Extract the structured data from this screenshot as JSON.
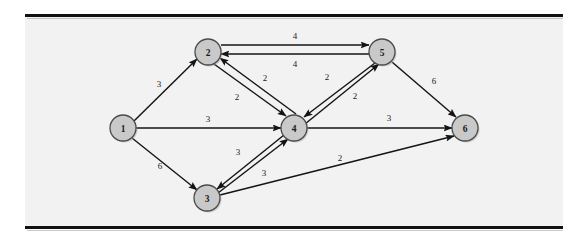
{
  "figure": {
    "background_color": "#f2f2f2",
    "page_color": "#ffffff",
    "rule_color": "#111111",
    "node_fill": "#c9c9c9",
    "node_stroke": "#4a4a4a",
    "edge_color": "#141414"
  },
  "chart_data": {
    "type": "diagram",
    "diagram_kind": "directed-weighted-graph",
    "title": "",
    "directed": true,
    "weighted": true,
    "nodes": [
      {
        "id": "1",
        "label": "1",
        "x": 123,
        "y": 128,
        "r": 13
      },
      {
        "id": "2",
        "label": "2",
        "x": 208,
        "y": 52,
        "r": 13
      },
      {
        "id": "3",
        "label": "3",
        "x": 207,
        "y": 198,
        "r": 13
      },
      {
        "id": "4",
        "label": "4",
        "x": 294,
        "y": 128,
        "r": 13
      },
      {
        "id": "5",
        "label": "5",
        "x": 382,
        "y": 52,
        "r": 13
      },
      {
        "id": "6",
        "label": "6",
        "x": 465,
        "y": 128,
        "r": 13
      }
    ],
    "edges": [
      {
        "from": "1",
        "to": "2",
        "weight": "3",
        "x1": 134,
        "y1": 121,
        "x2": 197,
        "y2": 59,
        "lx": 159,
        "ly": 84
      },
      {
        "from": "1",
        "to": "4",
        "weight": "3",
        "x1": 136,
        "y1": 128,
        "x2": 281,
        "y2": 128,
        "lx": 208,
        "ly": 119
      },
      {
        "from": "1",
        "to": "3",
        "weight": "6",
        "x1": 132,
        "y1": 138,
        "x2": 197,
        "y2": 190,
        "lx": 160,
        "ly": 166
      },
      {
        "from": "2",
        "to": "5",
        "weight": "4",
        "x1": 221,
        "y1": 45,
        "x2": 369,
        "y2": 45,
        "lx": 295,
        "ly": 36
      },
      {
        "from": "5",
        "to": "2",
        "weight": "4",
        "x1": 369,
        "y1": 54,
        "x2": 221,
        "y2": 54,
        "lx": 295,
        "ly": 64
      },
      {
        "from": "2",
        "to": "4",
        "weight": "2",
        "x1": 214,
        "y1": 64,
        "x2": 286,
        "y2": 116,
        "lx": 237,
        "ly": 97
      },
      {
        "from": "4",
        "to": "2",
        "weight": "2",
        "x1": 296,
        "y1": 114,
        "x2": 220,
        "y2": 58,
        "lx": 265,
        "ly": 78
      },
      {
        "from": "5",
        "to": "4",
        "weight": "2",
        "x1": 375,
        "y1": 63,
        "x2": 304,
        "y2": 117,
        "lx": 327,
        "ly": 77
      },
      {
        "from": "4",
        "to": "5",
        "weight": "2",
        "x1": 305,
        "y1": 124,
        "x2": 379,
        "y2": 64,
        "lx": 355,
        "ly": 96
      },
      {
        "from": "4",
        "to": "3",
        "weight": "3",
        "x1": 284,
        "y1": 135,
        "x2": 217,
        "y2": 189,
        "lx": 238,
        "ly": 152
      },
      {
        "from": "3",
        "to": "4",
        "weight": "3",
        "x1": 218,
        "y1": 193,
        "x2": 288,
        "y2": 139,
        "lx": 264,
        "ly": 173
      },
      {
        "from": "4",
        "to": "6",
        "weight": "3",
        "x1": 307,
        "y1": 128,
        "x2": 452,
        "y2": 128,
        "lx": 389,
        "ly": 118
      },
      {
        "from": "5",
        "to": "6",
        "weight": "6",
        "x1": 392,
        "y1": 62,
        "x2": 456,
        "y2": 117,
        "lx": 434,
        "ly": 81
      },
      {
        "from": "3",
        "to": "6",
        "weight": "2",
        "x1": 220,
        "y1": 195,
        "x2": 454,
        "y2": 136,
        "lx": 340,
        "ly": 158
      }
    ],
    "node_count": 6,
    "edge_count": 14,
    "weights_used": [
      "2",
      "3",
      "4",
      "6"
    ]
  }
}
